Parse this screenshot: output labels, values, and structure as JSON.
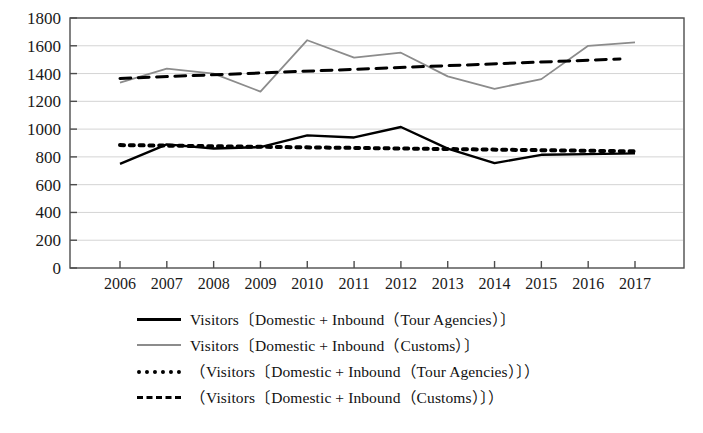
{
  "chart_data": {
    "type": "line",
    "title": "",
    "xlabel": "",
    "ylabel": "",
    "x": [
      2006,
      2007,
      2008,
      2009,
      2010,
      2011,
      2012,
      2013,
      2014,
      2015,
      2016,
      2017
    ],
    "xtick_labels": [
      "2006",
      "2007",
      "2008",
      "2009",
      "2010",
      "2011",
      "2012",
      "2013",
      "2014",
      "2015",
      "2016",
      "2017"
    ],
    "ytick_labels": [
      "0",
      "200",
      "400",
      "600",
      "800",
      "1000",
      "1200",
      "1400",
      "1600",
      "1800"
    ],
    "yticks": [
      0,
      200,
      400,
      600,
      800,
      1000,
      1200,
      1400,
      1600,
      1800
    ],
    "ylim": [
      0,
      1800
    ],
    "xlim": [
      2006,
      2017
    ],
    "grid": true,
    "grid_axis": "y",
    "legend_position": "below",
    "series": [
      {
        "name": "Visitors〔Domestic + Inbound（Tour Agencies）〕",
        "style": "solid",
        "color": "#000000",
        "width": 2.4,
        "values": [
          750,
          890,
          860,
          870,
          955,
          940,
          1015,
          860,
          755,
          815,
          820,
          825
        ]
      },
      {
        "name": "Visitors〔Domestic + Inbound（Customs）〕",
        "style": "solid",
        "color": "#8c8c8c",
        "width": 1.8,
        "values": [
          1335,
          1435,
          1400,
          1270,
          1640,
          1515,
          1550,
          1380,
          1290,
          1360,
          1600,
          1625
        ]
      },
      {
        "name": "（Visitors〔Domestic + Inbound（Tour Agencies）〕）",
        "style": "dotted",
        "color": "#000000",
        "width": 4,
        "trend": true,
        "endpoints": [
          885,
          840
        ]
      },
      {
        "name": "（Visitors〔Domestic + Inbound（Customs）〕）",
        "style": "dashed",
        "color": "#000000",
        "width": 3,
        "trend": true,
        "endpoints": [
          1365,
          1505
        ]
      }
    ]
  },
  "legend": {
    "items": [
      {
        "swatch": "solid-black",
        "label": "Visitors〔Domestic + Inbound（Tour Agencies）〕"
      },
      {
        "swatch": "solid-gray",
        "label": "Visitors〔Domestic + Inbound（Customs）〕"
      },
      {
        "swatch": "dotted",
        "label": "（Visitors〔Domestic + Inbound（Tour Agencies）〕）"
      },
      {
        "swatch": "dashed",
        "label": "（Visitors〔Domestic + Inbound（Customs）〕）"
      }
    ]
  }
}
